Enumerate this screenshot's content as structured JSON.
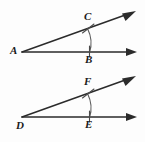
{
  "figure": {
    "background_color": "#fdfdfd",
    "stroke_color": "#2b2b2b",
    "arc_color": "#5a5a5a",
    "label_color": "#1a1a1a",
    "angles": [
      {
        "id": "angle-upper",
        "vertex_label": "A",
        "upper_ray_point_label": "C",
        "lower_ray_point_label": "B",
        "vertex": {
          "x": 22,
          "y": 52
        },
        "upper_ray_end": {
          "x": 136,
          "y": 12
        },
        "lower_ray_end": {
          "x": 136,
          "y": 52
        },
        "point_on_upper_ray": {
          "x": 88,
          "y": 28
        },
        "point_on_lower_ray": {
          "x": 89,
          "y": 52
        },
        "arc_marks": 1,
        "label_positions": {
          "vertex": {
            "x": 10,
            "y": 45
          },
          "upper": {
            "x": 84,
            "y": 11
          },
          "lower": {
            "x": 85,
            "y": 54
          }
        }
      },
      {
        "id": "angle-lower",
        "vertex_label": "D",
        "upper_ray_point_label": "F",
        "lower_ray_point_label": "E",
        "vertex": {
          "x": 22,
          "y": 117
        },
        "upper_ray_end": {
          "x": 136,
          "y": 77
        },
        "lower_ray_end": {
          "x": 136,
          "y": 117
        },
        "point_on_upper_ray": {
          "x": 88,
          "y": 93
        },
        "point_on_lower_ray": {
          "x": 89,
          "y": 117
        },
        "arc_marks": 1,
        "label_positions": {
          "vertex": {
            "x": 16,
            "y": 120
          },
          "upper": {
            "x": 84,
            "y": 76
          },
          "lower": {
            "x": 85,
            "y": 119
          }
        }
      }
    ]
  }
}
